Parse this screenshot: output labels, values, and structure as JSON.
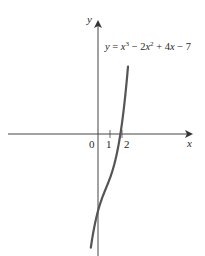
{
  "chart_data": {
    "type": "line",
    "title": "",
    "equation_label": "y = x^3 - 2x^2 + 4x - 7",
    "function": "x^3 - 2x^2 + 4x - 7",
    "xlabel": "x",
    "ylabel": "y",
    "x_ticks": [
      1,
      2
    ],
    "x_tick_labels": [
      "1",
      "2"
    ],
    "origin_label": "0",
    "xlim": [
      -8.2,
      7.8
    ],
    "ylim": [
      -11,
      10.5
    ],
    "grid": false,
    "legend": "none",
    "series": [
      {
        "name": "y = x^3 - 2x^2 + 4x - 7",
        "x": [
          -0.6,
          -0.4,
          -0.2,
          0,
          0.25,
          0.5,
          0.75,
          1.0,
          1.25,
          1.5,
          1.75,
          2.0,
          2.25,
          2.5
        ],
        "y": [
          -10.34,
          -8.98,
          -7.85,
          -7.0,
          -6.11,
          -5.38,
          -4.7,
          -4.0,
          -3.17,
          -2.13,
          -0.77,
          1.0,
          3.27,
          6.13
        ]
      }
    ],
    "annotations": [
      {
        "text": "y = x³ − 2x² + 4x − 7",
        "position": "upper right of y-axis"
      }
    ],
    "colors": {
      "curve": "#555555",
      "axes": "#444444"
    }
  },
  "labels": {
    "y_axis": "y",
    "x_axis": "x",
    "origin": "0",
    "tick_1": "1",
    "tick_2": "2",
    "eq_y": "y",
    "eq_eq": " = ",
    "eq_x1": "x",
    "eq_exp3": "3",
    "eq_minus2": " − 2",
    "eq_x2": "x",
    "eq_exp2": "2",
    "eq_plus4": " + 4",
    "eq_x3": "x",
    "eq_minus7": " − 7"
  }
}
